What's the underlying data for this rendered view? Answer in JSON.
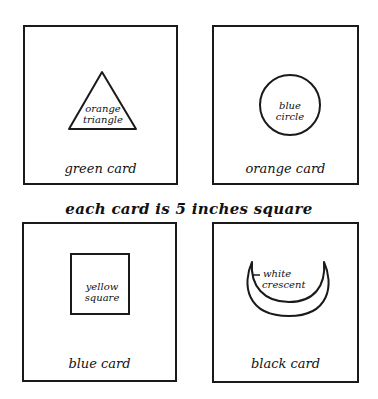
{
  "caption": "each card is 5 inches square",
  "cards": [
    {
      "card_label": "green card",
      "shape": "triangle",
      "shape_label_line1": "orange",
      "shape_label_line2": "triangle"
    },
    {
      "card_label": "orange card",
      "shape": "circle",
      "shape_label_line1": "blue",
      "shape_label_line2": "circle"
    },
    {
      "card_label": "blue card",
      "shape": "square",
      "shape_label_line1": "yellow",
      "shape_label_line2": "square"
    },
    {
      "card_label": "black card",
      "shape": "crescent",
      "shape_label_line1": "white",
      "shape_label_line2": "crescent"
    }
  ],
  "colors": {
    "ink": "#1a1a1a",
    "background": "#ffffff"
  }
}
